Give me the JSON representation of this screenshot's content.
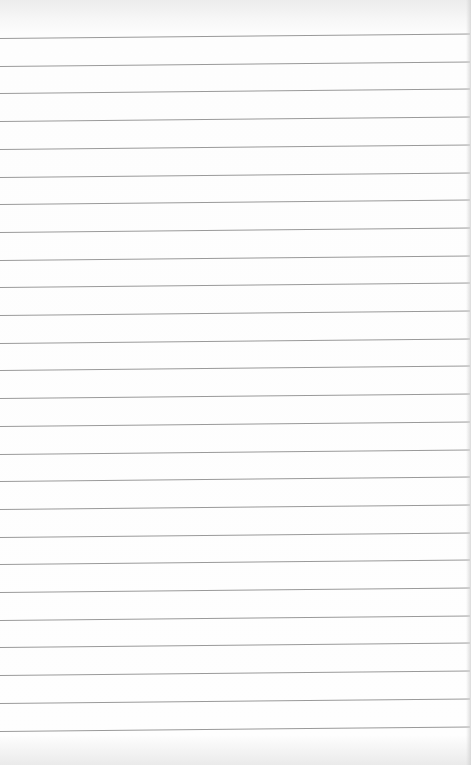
{
  "paper": {
    "type": "lined-notebook-page",
    "background_color": "#fefefe",
    "line_color": "#9a9a9a",
    "line_count": 26,
    "first_line_y": 38,
    "line_spacing": 27.7,
    "content": ""
  }
}
